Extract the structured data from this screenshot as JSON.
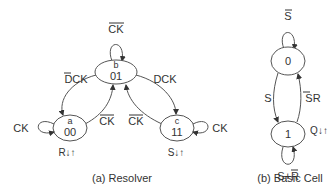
{
  "figure_a": {
    "caption": "(a) Resolver",
    "nodes": [
      {
        "id": "b",
        "name": "b",
        "code": "01",
        "self_loop": "CK",
        "self_loop_overline": true
      },
      {
        "id": "a",
        "name": "a",
        "code": "00",
        "self_loop": "CK",
        "self_loop_overline": false,
        "output": "R↓↑"
      },
      {
        "id": "c",
        "name": "c",
        "code": "11",
        "self_loop": "CK",
        "self_loop_overline": false,
        "output": "S↓↑"
      }
    ],
    "edges": [
      {
        "from": "b",
        "to": "a",
        "label_prefix": "D",
        "label_prefix_overline": true,
        "label_rest": "CK"
      },
      {
        "from": "b",
        "to": "c",
        "label": "DCK"
      },
      {
        "from": "a",
        "to": "b",
        "label": "CK",
        "overline": true
      },
      {
        "from": "c",
        "to": "b",
        "label": "CK",
        "overline": true
      }
    ]
  },
  "figure_b": {
    "caption": "(b) Basic Cell",
    "nodes": [
      {
        "id": "0",
        "code": "0",
        "self_loop": "S",
        "self_loop_overline": true
      },
      {
        "id": "1",
        "code": "1",
        "self_loop_s": "S+",
        "self_loop_r": "R",
        "output": "Q↓↑"
      }
    ],
    "edges": [
      {
        "from": "0",
        "to": "1",
        "label": "S"
      },
      {
        "from": "1",
        "to": "0",
        "label_prefix": "S",
        "label_prefix_overline": true,
        "label_rest": "R"
      }
    ]
  }
}
